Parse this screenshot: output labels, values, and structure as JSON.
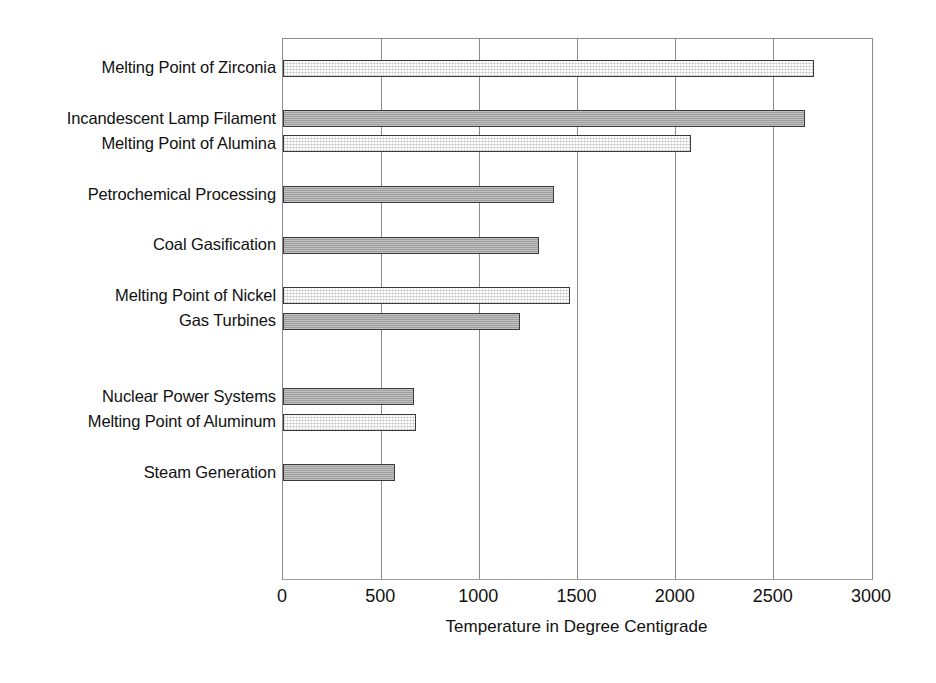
{
  "chart_data": {
    "type": "bar",
    "orientation": "horizontal",
    "title": "",
    "xlabel": "Temperature in Degree Centigrade",
    "ylabel": "",
    "xlim": [
      0,
      3000
    ],
    "xticks": [
      "0",
      "500",
      "1000",
      "1500",
      "2000",
      "2500",
      "3000"
    ],
    "xtick_values": [
      0,
      500,
      1000,
      1500,
      2000,
      2500,
      3000
    ],
    "grid": true,
    "legend": "none",
    "categories": [
      "Melting Point of Zirconia",
      "Incandescent Lamp Filament",
      "Melting Point of Alumina",
      "Petrochemical Processing",
      "Coal Gasification",
      "Melting Point of Nickel",
      "Gas Turbines",
      "Nuclear Power Systems",
      "Melting Point of Aluminum",
      "Steam Generation"
    ],
    "values": [
      2705,
      2660,
      2080,
      1380,
      1305,
      1460,
      1205,
      665,
      675,
      570
    ],
    "bars": [
      {
        "label": "Melting Point of Zirconia",
        "value": 2705,
        "style": "hollow",
        "row": 0
      },
      {
        "label": "Incandescent Lamp Filament",
        "value": 2660,
        "style": "solid",
        "row": 2
      },
      {
        "label": "Melting Point of Alumina",
        "value": 2080,
        "style": "hollow",
        "row": 3
      },
      {
        "label": "Petrochemical Processing",
        "value": 1380,
        "style": "solid",
        "row": 5
      },
      {
        "label": "Coal Gasification",
        "value": 1305,
        "style": "solid",
        "row": 7
      },
      {
        "label": "Melting Point of Nickel",
        "value": 1460,
        "style": "hollow",
        "row": 9
      },
      {
        "label": "Gas Turbines",
        "value": 1205,
        "style": "solid",
        "row": 10
      },
      {
        "label": "Nuclear Power Systems",
        "value": 665,
        "style": "solid",
        "row": 13
      },
      {
        "label": "Melting Point of Aluminum",
        "value": 675,
        "style": "hollow",
        "row": 14
      },
      {
        "label": "Steam Generation",
        "value": 570,
        "style": "solid",
        "row": 16
      }
    ],
    "colors": {
      "bar_solid_fill": "#a6a6a6",
      "bar_hollow_fill": "#fdfdfd",
      "bar_edge": "#3a3a3a",
      "gridline": "#8c8c8c",
      "text": "#111111",
      "background": "#ffffff"
    }
  }
}
